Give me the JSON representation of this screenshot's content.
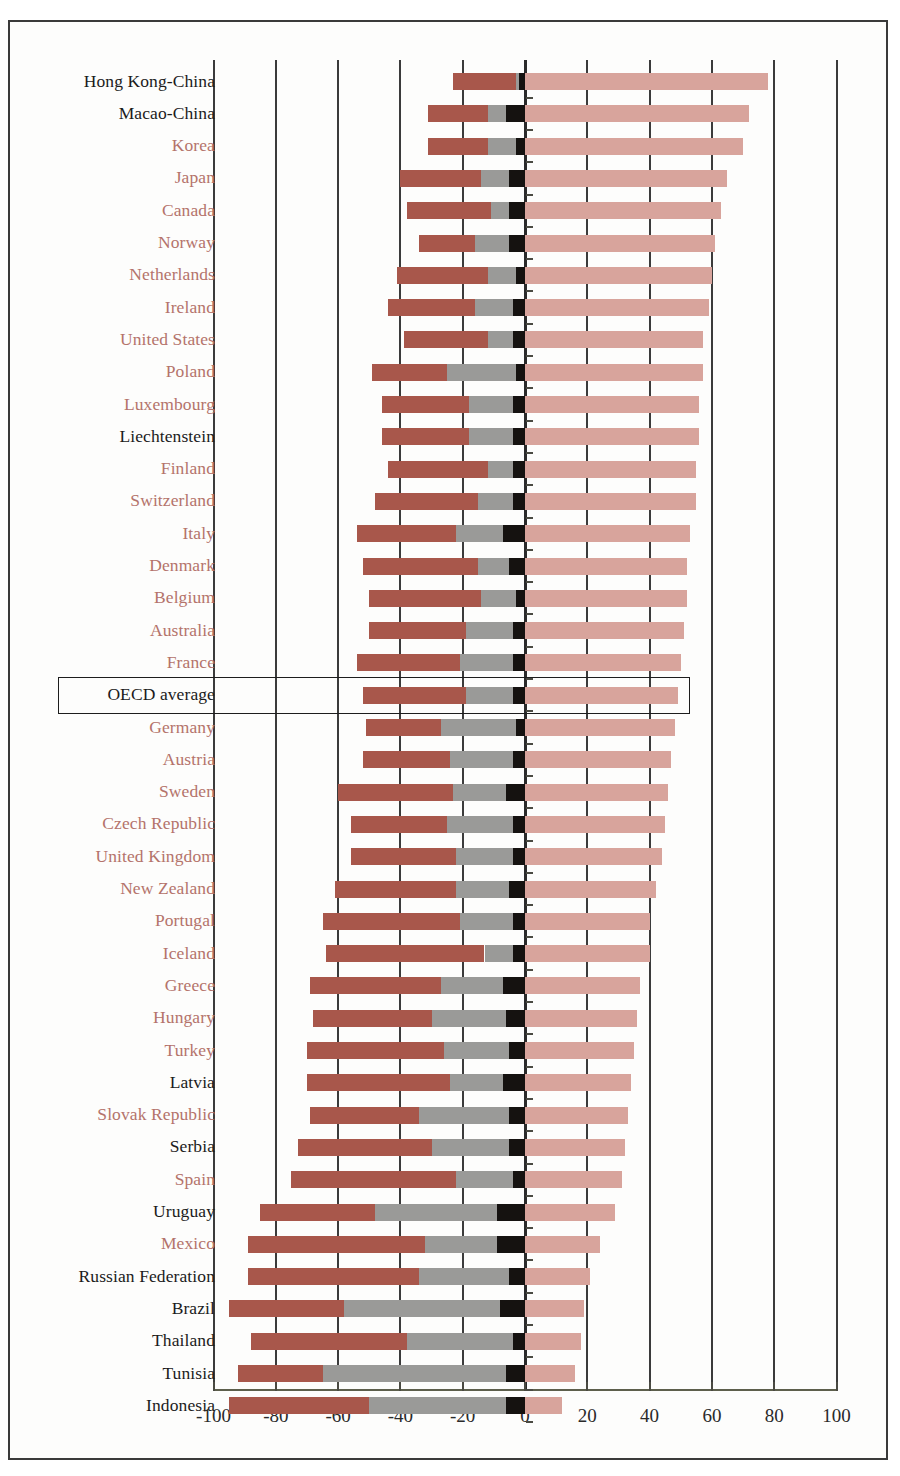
{
  "chart_data": {
    "type": "bar",
    "orientation": "horizontal",
    "subtype": "diverging-stacked",
    "title": "",
    "subtitle": "",
    "xlabel": "",
    "ylabel": "",
    "xlim": [
      -100,
      100
    ],
    "xticks": [
      -100,
      -80,
      -60,
      -40,
      -20,
      0,
      20,
      40,
      60,
      80,
      100
    ],
    "xtick_labels": [
      "-100",
      "-80",
      "-60",
      "-40",
      "-20",
      "0",
      "20",
      "40",
      "60",
      "80",
      "100"
    ],
    "grid": true,
    "grid_axis": "x",
    "legend": [],
    "legend_position": "none",
    "highlight_row": "OECD average",
    "colors": {
      "negative_dark_red": "#a8574b",
      "negative_gray": "#9a9a98",
      "zero_black": "#151210",
      "positive_pink": "#d8a49c",
      "gridline": "#3b3b3b",
      "axis": "#5d5f4c",
      "label_red": "#b4736b",
      "label_dark": "#1b1b1b",
      "frame": "#3a3a3a",
      "page_background": "#fdfdfc"
    },
    "series": [
      {
        "name": "dark-red segment",
        "color": "#a8574b"
      },
      {
        "name": "gray segment",
        "color": "#9a9a98"
      },
      {
        "name": "black segment",
        "color": "#151210"
      },
      {
        "name": "pink segment",
        "color": "#d8a49c"
      }
    ],
    "categories": [
      "Hong Kong-China",
      "Macao-China",
      "Korea",
      "Japan",
      "Canada",
      "Norway",
      "Netherlands",
      "Ireland",
      "United States",
      "Poland",
      "Luxembourg",
      "Liechtenstein",
      "Finland",
      "Switzerland",
      "Italy",
      "Denmark",
      "Belgium",
      "Australia",
      "France",
      "OECD average",
      "Germany",
      "Austria",
      "Sweden",
      "Czech Republic",
      "United Kingdom",
      "New Zealand",
      "Portugal",
      "Iceland",
      "Greece",
      "Hungary",
      "Turkey",
      "Latvia",
      "Slovak Republic",
      "Serbia",
      "Spain",
      "Uruguay",
      "Mexico",
      "Russian Federation",
      "Brazil",
      "Thailand",
      "Tunisia",
      "Indonesia"
    ],
    "rows": [
      {
        "country": "Hong Kong-China",
        "label_color": "dark",
        "neg_start": -23,
        "gray_start": -3,
        "black_start": -2,
        "pos_end": 78
      },
      {
        "country": "Macao-China",
        "label_color": "dark",
        "neg_start": -31,
        "gray_start": -12,
        "black_start": -6,
        "pos_end": 72
      },
      {
        "country": "Korea",
        "label_color": "red",
        "neg_start": -31,
        "gray_start": -12,
        "black_start": -3,
        "pos_end": 70
      },
      {
        "country": "Japan",
        "label_color": "red",
        "neg_start": -40,
        "gray_start": -14,
        "black_start": -5,
        "pos_end": 65
      },
      {
        "country": "Canada",
        "label_color": "red",
        "neg_start": -38,
        "gray_start": -11,
        "black_start": -5,
        "pos_end": 63
      },
      {
        "country": "Norway",
        "label_color": "red",
        "neg_start": -34,
        "gray_start": -16,
        "black_start": -5,
        "pos_end": 61
      },
      {
        "country": "Netherlands",
        "label_color": "red",
        "neg_start": -41,
        "gray_start": -12,
        "black_start": -3,
        "pos_end": 60
      },
      {
        "country": "Ireland",
        "label_color": "red",
        "neg_start": -44,
        "gray_start": -16,
        "black_start": -4,
        "pos_end": 59
      },
      {
        "country": "United States",
        "label_color": "red",
        "neg_start": -39,
        "gray_start": -12,
        "black_start": -4,
        "pos_end": 57
      },
      {
        "country": "Poland",
        "label_color": "red",
        "neg_start": -49,
        "gray_start": -25,
        "black_start": -3,
        "pos_end": 57
      },
      {
        "country": "Luxembourg",
        "label_color": "red",
        "neg_start": -46,
        "gray_start": -18,
        "black_start": -4,
        "pos_end": 56
      },
      {
        "country": "Liechtenstein",
        "label_color": "dark",
        "neg_start": -46,
        "gray_start": -18,
        "black_start": -4,
        "pos_end": 56
      },
      {
        "country": "Finland",
        "label_color": "red",
        "neg_start": -44,
        "gray_start": -12,
        "black_start": -4,
        "pos_end": 55
      },
      {
        "country": "Switzerland",
        "label_color": "red",
        "neg_start": -48,
        "gray_start": -15,
        "black_start": -4,
        "pos_end": 55
      },
      {
        "country": "Italy",
        "label_color": "red",
        "neg_start": -54,
        "gray_start": -22,
        "black_start": -7,
        "pos_end": 53
      },
      {
        "country": "Denmark",
        "label_color": "red",
        "neg_start": -52,
        "gray_start": -15,
        "black_start": -5,
        "pos_end": 52
      },
      {
        "country": "Belgium",
        "label_color": "red",
        "neg_start": -50,
        "gray_start": -14,
        "black_start": -3,
        "pos_end": 52
      },
      {
        "country": "Australia",
        "label_color": "red",
        "neg_start": -50,
        "gray_start": -19,
        "black_start": -4,
        "pos_end": 51
      },
      {
        "country": "France",
        "label_color": "red",
        "neg_start": -54,
        "gray_start": -21,
        "black_start": -4,
        "pos_end": 50
      },
      {
        "country": "OECD average",
        "label_color": "dark",
        "neg_start": -52,
        "gray_start": -19,
        "black_start": -4,
        "pos_end": 49
      },
      {
        "country": "Germany",
        "label_color": "red",
        "neg_start": -51,
        "gray_start": -27,
        "black_start": -3,
        "pos_end": 48
      },
      {
        "country": "Austria",
        "label_color": "red",
        "neg_start": -52,
        "gray_start": -24,
        "black_start": -4,
        "pos_end": 47
      },
      {
        "country": "Sweden",
        "label_color": "red",
        "neg_start": -60,
        "gray_start": -23,
        "black_start": -6,
        "pos_end": 46
      },
      {
        "country": "Czech Republic",
        "label_color": "red",
        "neg_start": -56,
        "gray_start": -25,
        "black_start": -4,
        "pos_end": 45
      },
      {
        "country": "United Kingdom",
        "label_color": "red",
        "neg_start": -56,
        "gray_start": -22,
        "black_start": -4,
        "pos_end": 44
      },
      {
        "country": "New Zealand",
        "label_color": "red",
        "neg_start": -61,
        "gray_start": -22,
        "black_start": -5,
        "pos_end": 42
      },
      {
        "country": "Portugal",
        "label_color": "red",
        "neg_start": -65,
        "gray_start": -21,
        "black_start": -4,
        "pos_end": 40
      },
      {
        "country": "Iceland",
        "label_color": "red",
        "neg_start": -64,
        "gray_start": -13,
        "black_start": -4,
        "pos_end": 40
      },
      {
        "country": "Greece",
        "label_color": "red",
        "neg_start": -69,
        "gray_start": -27,
        "black_start": -7,
        "pos_end": 37
      },
      {
        "country": "Hungary",
        "label_color": "red",
        "neg_start": -68,
        "gray_start": -30,
        "black_start": -6,
        "pos_end": 36
      },
      {
        "country": "Turkey",
        "label_color": "red",
        "neg_start": -70,
        "gray_start": -26,
        "black_start": -5,
        "pos_end": 35
      },
      {
        "country": "Latvia",
        "label_color": "dark",
        "neg_start": -70,
        "gray_start": -24,
        "black_start": -7,
        "pos_end": 34
      },
      {
        "country": "Slovak Republic",
        "label_color": "red",
        "neg_start": -69,
        "gray_start": -34,
        "black_start": -5,
        "pos_end": 33
      },
      {
        "country": "Serbia",
        "label_color": "dark",
        "neg_start": -73,
        "gray_start": -30,
        "black_start": -5,
        "pos_end": 32
      },
      {
        "country": "Spain",
        "label_color": "red",
        "neg_start": -75,
        "gray_start": -22,
        "black_start": -4,
        "pos_end": 31
      },
      {
        "country": "Uruguay",
        "label_color": "dark",
        "neg_start": -85,
        "gray_start": -48,
        "black_start": -9,
        "pos_end": 29
      },
      {
        "country": "Mexico",
        "label_color": "red",
        "neg_start": -89,
        "gray_start": -32,
        "black_start": -9,
        "pos_end": 24
      },
      {
        "country": "Russian Federation",
        "label_color": "dark",
        "neg_start": -89,
        "gray_start": -34,
        "black_start": -5,
        "pos_end": 21
      },
      {
        "country": "Brazil",
        "label_color": "dark",
        "neg_start": -95,
        "gray_start": -58,
        "black_start": -8,
        "pos_end": 19
      },
      {
        "country": "Thailand",
        "label_color": "dark",
        "neg_start": -88,
        "gray_start": -38,
        "black_start": -4,
        "pos_end": 18
      },
      {
        "country": "Tunisia",
        "label_color": "dark",
        "neg_start": -92,
        "gray_start": -65,
        "black_start": -6,
        "pos_end": 16
      },
      {
        "country": "Indonesia",
        "label_color": "dark",
        "neg_start": -95,
        "gray_start": -50,
        "black_start": -6,
        "pos_end": 12
      }
    ]
  }
}
